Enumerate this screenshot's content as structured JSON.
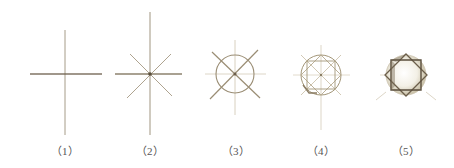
{
  "diagram": {
    "title": "",
    "stroke_color": "#6b5e4a",
    "light_stroke_color": "#cfc6b4",
    "steps": [
      {
        "label": "（1）",
        "description": "cross: vertical and horizontal guide lines",
        "cx": 65,
        "cy": 74
      },
      {
        "label": "（2）",
        "description": "eight-ray star: cross plus two diagonals",
        "cx": 150,
        "cy": 74
      },
      {
        "label": "（3）",
        "description": "circle drawn over guide lines with diagonal X",
        "cx": 235,
        "cy": 74
      },
      {
        "label": "（4）",
        "description": "circle with inscribed square construction",
        "cx": 321,
        "cy": 75
      },
      {
        "label": "（5）",
        "description": "octagram from two overlapping squares, shaded",
        "cx": 406,
        "cy": 75
      }
    ]
  }
}
